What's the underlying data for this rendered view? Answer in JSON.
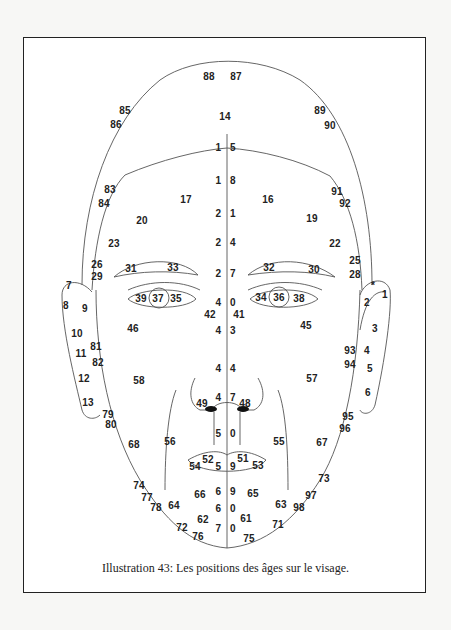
{
  "caption": "Illustration 43: Les positions des âges sur le visage.",
  "figure": {
    "type": "face-age-map",
    "labels": [
      {
        "t": "88",
        "x": 209,
        "y": 76
      },
      {
        "t": "87",
        "x": 236,
        "y": 76
      },
      {
        "t": "85",
        "x": 125,
        "y": 110
      },
      {
        "t": "86",
        "x": 116,
        "y": 124
      },
      {
        "t": "14",
        "x": 225,
        "y": 116
      },
      {
        "t": "89",
        "x": 320,
        "y": 110
      },
      {
        "t": "90",
        "x": 330,
        "y": 125
      },
      {
        "t": "1 5",
        "x": 227,
        "y": 147,
        "sp": true
      },
      {
        "t": "1 8",
        "x": 227,
        "y": 180,
        "sp": true
      },
      {
        "t": "83",
        "x": 110,
        "y": 189
      },
      {
        "t": "84",
        "x": 104,
        "y": 203
      },
      {
        "t": "17",
        "x": 186,
        "y": 199
      },
      {
        "t": "16",
        "x": 268,
        "y": 199
      },
      {
        "t": "91",
        "x": 337,
        "y": 191
      },
      {
        "t": "92",
        "x": 345,
        "y": 203
      },
      {
        "t": "20",
        "x": 142,
        "y": 220
      },
      {
        "t": "19",
        "x": 312,
        "y": 218
      },
      {
        "t": "2 1",
        "x": 227,
        "y": 213,
        "sp": true
      },
      {
        "t": "23",
        "x": 114,
        "y": 243
      },
      {
        "t": "22",
        "x": 335,
        "y": 243
      },
      {
        "t": "2 4",
        "x": 227,
        "y": 242,
        "sp": true
      },
      {
        "t": "26",
        "x": 97,
        "y": 264
      },
      {
        "t": "29",
        "x": 97,
        "y": 276
      },
      {
        "t": "25",
        "x": 355,
        "y": 260
      },
      {
        "t": "28",
        "x": 355,
        "y": 274
      },
      {
        "t": "31",
        "x": 131,
        "y": 268
      },
      {
        "t": "33",
        "x": 173,
        "y": 267
      },
      {
        "t": "32",
        "x": 269,
        "y": 267
      },
      {
        "t": "30",
        "x": 314,
        "y": 269
      },
      {
        "t": "2 7",
        "x": 227,
        "y": 273,
        "sp": true
      },
      {
        "t": "7",
        "x": 69,
        "y": 285
      },
      {
        "t": "8",
        "x": 66,
        "y": 305
      },
      {
        "t": "9",
        "x": 85,
        "y": 308
      },
      {
        "t": "*",
        "x": 373,
        "y": 285
      },
      {
        "t": "1",
        "x": 385,
        "y": 294
      },
      {
        "t": "2",
        "x": 367,
        "y": 302
      },
      {
        "t": "39",
        "x": 141,
        "y": 298
      },
      {
        "t": "37",
        "x": 158,
        "y": 298
      },
      {
        "t": "35",
        "x": 176,
        "y": 298
      },
      {
        "t": "34",
        "x": 261,
        "y": 297
      },
      {
        "t": "36",
        "x": 279,
        "y": 297
      },
      {
        "t": "38",
        "x": 299,
        "y": 298
      },
      {
        "t": "4 0",
        "x": 227,
        "y": 302,
        "sp": true
      },
      {
        "t": "42",
        "x": 210,
        "y": 314
      },
      {
        "t": "41",
        "x": 239,
        "y": 314
      },
      {
        "t": "46",
        "x": 133,
        "y": 328
      },
      {
        "t": "45",
        "x": 306,
        "y": 325
      },
      {
        "t": "4 3",
        "x": 227,
        "y": 330,
        "sp": true
      },
      {
        "t": "3",
        "x": 375,
        "y": 328
      },
      {
        "t": "10",
        "x": 77,
        "y": 333
      },
      {
        "t": "81",
        "x": 96,
        "y": 346
      },
      {
        "t": "11",
        "x": 81,
        "y": 353
      },
      {
        "t": "82",
        "x": 98,
        "y": 362
      },
      {
        "t": "93",
        "x": 350,
        "y": 350
      },
      {
        "t": "4",
        "x": 367,
        "y": 350
      },
      {
        "t": "94",
        "x": 350,
        "y": 364
      },
      {
        "t": "5",
        "x": 370,
        "y": 368
      },
      {
        "t": "4 4",
        "x": 227,
        "y": 368,
        "sp": true
      },
      {
        "t": "12",
        "x": 84,
        "y": 378
      },
      {
        "t": "58",
        "x": 139,
        "y": 380
      },
      {
        "t": "57",
        "x": 312,
        "y": 378
      },
      {
        "t": "6",
        "x": 368,
        "y": 392
      },
      {
        "t": "13",
        "x": 88,
        "y": 402
      },
      {
        "t": "4 7",
        "x": 227,
        "y": 397,
        "sp": true
      },
      {
        "t": "49",
        "x": 202,
        "y": 403
      },
      {
        "t": "48",
        "x": 245,
        "y": 403
      },
      {
        "t": "79",
        "x": 108,
        "y": 414
      },
      {
        "t": "80",
        "x": 111,
        "y": 424
      },
      {
        "t": "95",
        "x": 348,
        "y": 416
      },
      {
        "t": "96",
        "x": 345,
        "y": 428
      },
      {
        "t": "5 0",
        "x": 227,
        "y": 433,
        "sp": true
      },
      {
        "t": "68",
        "x": 134,
        "y": 444
      },
      {
        "t": "56",
        "x": 170,
        "y": 441
      },
      {
        "t": "55",
        "x": 279,
        "y": 441
      },
      {
        "t": "67",
        "x": 322,
        "y": 442
      },
      {
        "t": "52",
        "x": 208,
        "y": 459
      },
      {
        "t": "51",
        "x": 243,
        "y": 458
      },
      {
        "t": "54",
        "x": 195,
        "y": 466
      },
      {
        "t": "53",
        "x": 258,
        "y": 465
      },
      {
        "t": "5 9",
        "x": 227,
        "y": 466,
        "sp": true
      },
      {
        "t": "73",
        "x": 324,
        "y": 478
      },
      {
        "t": "74",
        "x": 139,
        "y": 485
      },
      {
        "t": "97",
        "x": 311,
        "y": 495
      },
      {
        "t": "77",
        "x": 147,
        "y": 497
      },
      {
        "t": "66",
        "x": 200,
        "y": 494
      },
      {
        "t": "6 9",
        "x": 227,
        "y": 491,
        "sp": true
      },
      {
        "t": "65",
        "x": 253,
        "y": 493
      },
      {
        "t": "78",
        "x": 156,
        "y": 507
      },
      {
        "t": "64",
        "x": 174,
        "y": 505
      },
      {
        "t": "63",
        "x": 281,
        "y": 504
      },
      {
        "t": "98",
        "x": 299,
        "y": 507
      },
      {
        "t": "6 0",
        "x": 227,
        "y": 508,
        "sp": true
      },
      {
        "t": "62",
        "x": 203,
        "y": 519
      },
      {
        "t": "61",
        "x": 246,
        "y": 518
      },
      {
        "t": "71",
        "x": 278,
        "y": 524
      },
      {
        "t": "72",
        "x": 182,
        "y": 527
      },
      {
        "t": "76",
        "x": 198,
        "y": 536
      },
      {
        "t": "7 0",
        "x": 227,
        "y": 528,
        "sp": true
      },
      {
        "t": "75",
        "x": 249,
        "y": 538
      }
    ]
  }
}
